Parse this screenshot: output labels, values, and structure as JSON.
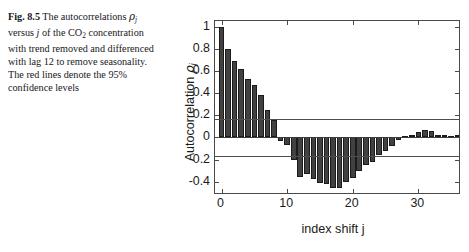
{
  "caption": {
    "fig_label": "Fig. 8.5",
    "text_part1": "The autocorrelations ",
    "rho": "ρ",
    "sub_j": "j",
    "text_part2": " versus ",
    "j_italic": "j",
    "text_part3": " of the CO",
    "sub_2": "2",
    "text_part4": " concentration with trend removed and differenced with lag 12 to remove seasonality. The red lines denote the 95% confidence levels"
  },
  "chart_data": {
    "type": "bar",
    "title": "",
    "xlabel": "index shift j",
    "ylabel": "Autocorrelation ρj",
    "ylabel_base": "Autocorrelation",
    "ylabel_rho": "ρ",
    "ylabel_sub": "j",
    "xlim": [
      -1,
      36.5
    ],
    "ylim": [
      -0.52,
      1.05
    ],
    "xticks": [
      0,
      10,
      20,
      30
    ],
    "xticklabels": [
      "0",
      "10",
      "20",
      "30"
    ],
    "yticks": [
      1,
      0.8,
      0.6,
      0.4,
      0.2,
      0,
      -0.2,
      -0.4
    ],
    "yticklabels": [
      "1",
      "0.8",
      "0.6",
      "0.4",
      "0.2",
      "0",
      "-0.2",
      "-0.4"
    ],
    "grid": false,
    "legend": "none",
    "bar_color": "#414141",
    "confidence_line_color": "#4e4e4e",
    "confidence_levels": [
      0.17,
      -0.17
    ],
    "x": [
      0,
      1,
      2,
      3,
      4,
      5,
      6,
      7,
      8,
      9,
      10,
      11,
      12,
      13,
      14,
      15,
      16,
      17,
      18,
      19,
      20,
      21,
      22,
      23,
      24,
      25,
      26,
      27,
      28,
      29,
      30,
      31,
      32,
      33,
      34,
      35,
      36
    ],
    "values": [
      1.0,
      0.8,
      0.69,
      0.62,
      0.53,
      0.47,
      0.38,
      0.25,
      0.16,
      -0.03,
      -0.07,
      -0.2,
      -0.36,
      -0.33,
      -0.38,
      -0.41,
      -0.42,
      -0.46,
      -0.46,
      -0.4,
      -0.37,
      -0.3,
      -0.25,
      -0.22,
      -0.16,
      -0.12,
      -0.08,
      -0.02,
      0.01,
      0.02,
      0.05,
      0.07,
      0.06,
      0.02,
      0.02,
      0.01,
      0.02
    ],
    "annotations": []
  }
}
